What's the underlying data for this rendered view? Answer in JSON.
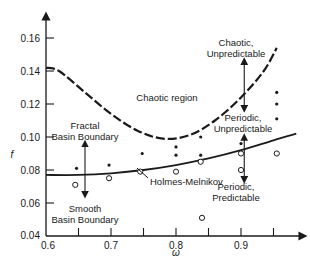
{
  "chart_data": {
    "type": "scatter",
    "title": "",
    "xlabel": "ω",
    "ylabel": "f",
    "xlim": [
      0.6,
      0.98
    ],
    "ylim": [
      0.04,
      0.175
    ],
    "grid": false,
    "x_ticks": [
      0.6,
      0.65,
      0.7,
      0.75,
      0.8,
      0.85,
      0.9,
      0.95
    ],
    "x_tick_labels": [
      "0.6",
      "",
      "0.7",
      "",
      "0.8",
      "",
      "0.9",
      ""
    ],
    "y_ticks": [
      0.04,
      0.06,
      0.08,
      0.1,
      0.12,
      0.14,
      0.16
    ],
    "y_tick_labels": [
      "0.04",
      "0.06",
      "0.08",
      "0.10",
      "0.12",
      "0.14",
      "0.16"
    ],
    "series": [
      {
        "name": "Chaotic threshold (dashed)",
        "kind": "line",
        "style": "dashed",
        "x": [
          0.6,
          0.62,
          0.66,
          0.7,
          0.74,
          0.78,
          0.82,
          0.86,
          0.9,
          0.935,
          0.955
        ],
        "y": [
          0.142,
          0.14,
          0.127,
          0.114,
          0.104,
          0.099,
          0.101,
          0.11,
          0.124,
          0.14,
          0.154
        ]
      },
      {
        "name": "Holmes-Melnikov (solid)",
        "kind": "line",
        "style": "solid",
        "x": [
          0.6,
          0.65,
          0.7,
          0.75,
          0.8,
          0.85,
          0.9,
          0.95,
          0.985
        ],
        "y": [
          0.077,
          0.077,
          0.078,
          0.08,
          0.083,
          0.087,
          0.092,
          0.098,
          0.102
        ]
      },
      {
        "name": "Fractal basin (filled dots)",
        "kind": "scatter",
        "marker": "dot",
        "x": [
          0.647,
          0.697,
          0.748,
          0.8,
          0.8,
          0.838,
          0.838,
          0.9,
          0.955,
          0.955,
          0.955
        ],
        "y": [
          0.081,
          0.083,
          0.09,
          0.094,
          0.089,
          0.1,
          0.089,
          0.096,
          0.127,
          0.12,
          0.111
        ]
      },
      {
        "name": "Smooth basin (open circles)",
        "kind": "scatter",
        "marker": "circle-open",
        "x": [
          0.645,
          0.697,
          0.745,
          0.8,
          0.838,
          0.84,
          0.9,
          0.9,
          0.955
        ],
        "y": [
          0.071,
          0.075,
          0.079,
          0.079,
          0.085,
          0.051,
          0.09,
          0.08,
          0.09
        ]
      }
    ],
    "annotations": [
      {
        "text": "Chaotic region",
        "x": 0.785,
        "y": 0.125
      },
      {
        "text": "Chaotic,",
        "x": 0.905,
        "y": 0.156
      },
      {
        "text": "Unpredictable",
        "x": 0.905,
        "y": 0.149
      },
      {
        "text": "Periodic,",
        "x": 0.905,
        "y": 0.112
      },
      {
        "text": "Unpredictable",
        "x": 0.905,
        "y": 0.105
      },
      {
        "text": "Fractal",
        "x": 0.66,
        "y": 0.107
      },
      {
        "text": "Basin Boundary",
        "x": 0.66,
        "y": 0.1
      },
      {
        "text": "Holmes-Melnikov",
        "x": 0.77,
        "y": 0.073
      },
      {
        "text": "Periodic,",
        "x": 0.905,
        "y": 0.07
      },
      {
        "text": "Predictable",
        "x": 0.905,
        "y": 0.063
      },
      {
        "text": "Smooth",
        "x": 0.66,
        "y": 0.057
      },
      {
        "text": "Basin Boundary",
        "x": 0.66,
        "y": 0.05
      }
    ],
    "arrows": [
      {
        "name": "fractal-smooth",
        "x": 0.66,
        "y_from": 0.096,
        "y_to": 0.065,
        "double": true
      },
      {
        "name": "chaotic-periodic-unpredictable",
        "x": 0.905,
        "y_from": 0.146,
        "y_to": 0.117,
        "double": true
      },
      {
        "name": "periodic-unpredictable-predictable",
        "x": 0.905,
        "y_from": 0.1,
        "y_to": 0.074,
        "double": true
      }
    ],
    "legend": null
  },
  "labels": {
    "chaotic_region": "Chaotic region",
    "chaotic_line1": "Chaotic,",
    "chaotic_line2": "Unpredictable",
    "per_unpred_line1": "Periodic,",
    "per_unpred_line2": "Unpredictable",
    "fractal_line1": "Fractal",
    "fractal_line2": "Basin Boundary",
    "holmes": "Holmes-Melnikov",
    "per_pred_line1": "Periodic,",
    "per_pred_line2": "Predictable",
    "smooth_line1": "Smooth",
    "smooth_line2": "Basin Boundary",
    "xlabel": "ω",
    "ylabel": "f"
  }
}
